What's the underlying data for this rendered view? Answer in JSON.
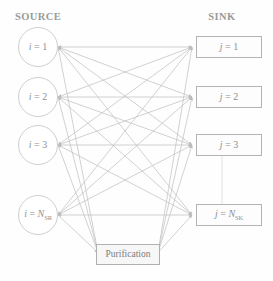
{
  "headers": {
    "source": "SOURCE",
    "sink": "SINK"
  },
  "colors": {
    "edge": "#c2c2c2",
    "node_border": "#bdbdbd",
    "text": "#8f8f8f",
    "background": "#fefefe",
    "purification_fill": "#f7f7f7"
  },
  "source_nodes": [
    {
      "id": "source-1",
      "label_prefix": "i = ",
      "label_value": "1",
      "label_sub": "",
      "label_full": "i = 1",
      "cx": 38,
      "cy": 47,
      "r": 20
    },
    {
      "id": "source-2",
      "label_prefix": "i = ",
      "label_value": "2",
      "label_sub": "",
      "label_full": "i = 2",
      "cx": 38,
      "cy": 97,
      "r": 20
    },
    {
      "id": "source-3",
      "label_prefix": "i = ",
      "label_value": "3",
      "label_sub": "",
      "label_full": "i = 3",
      "cx": 38,
      "cy": 145,
      "r": 20
    },
    {
      "id": "source-nsr",
      "label_prefix": "i = ",
      "label_value": "N",
      "label_sub": "SR",
      "label_full": "i = N_SR",
      "cx": 38,
      "cy": 215,
      "r": 20
    }
  ],
  "sink_nodes": [
    {
      "id": "sink-1",
      "label_prefix": "j = ",
      "label_value": "1",
      "label_sub": "",
      "label_full": "j = 1",
      "x": 196,
      "y": 36,
      "w": 66,
      "h": 22
    },
    {
      "id": "sink-2",
      "label_prefix": "j = ",
      "label_value": "2",
      "label_sub": "",
      "label_full": "j = 2",
      "x": 196,
      "y": 86,
      "w": 66,
      "h": 22
    },
    {
      "id": "sink-3",
      "label_prefix": "j = ",
      "label_value": "3",
      "label_sub": "",
      "label_full": "j = 3",
      "x": 196,
      "y": 134,
      "w": 66,
      "h": 22
    },
    {
      "id": "sink-nsk",
      "label_prefix": "j = ",
      "label_value": "N",
      "label_sub": "SK",
      "label_full": "j = N_SK",
      "x": 196,
      "y": 204,
      "w": 66,
      "h": 22
    }
  ],
  "purification": {
    "label": "Purification",
    "x": 96,
    "y": 244,
    "w": 64,
    "h": 21
  },
  "ellipsis_connector": {
    "description": "vertical continuation line between sink 3 and sink N_SK",
    "x": 222,
    "y1": 156,
    "y2": 204
  },
  "graph": {
    "type": "bipartite-flow",
    "source_count_shown": 4,
    "sink_count_shown": 4,
    "edges_source_to_sink": "complete-bipartite",
    "edges_source_to_purification": true,
    "edges_purification_to_sink": true,
    "arrowheads": "both-ends"
  }
}
